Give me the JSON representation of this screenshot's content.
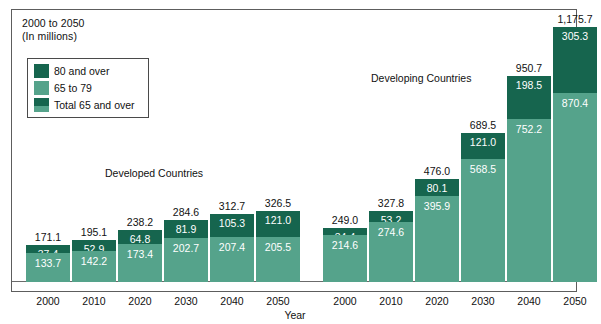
{
  "figure": {
    "title_line1": "2000 to 2050",
    "title_line2": "(In millions)",
    "xaxis_title": "Year",
    "group_label_developed": "Developed Countries",
    "group_label_developing": "Developing Countries",
    "colors": {
      "upper_segment": "#16654e",
      "lower_segment": "#55a38b",
      "frame": "#5d5d5d",
      "text": "#111111",
      "value_text": "#ffffff"
    }
  },
  "legend": {
    "items": [
      {
        "label": "80 and over",
        "swatch": "dark"
      },
      {
        "label": "65 to 79",
        "swatch": "light"
      },
      {
        "label": "Total 65 and over",
        "swatch": "stack"
      }
    ]
  },
  "chart_data": {
    "type": "bar",
    "title": "2000 to 2050 (In millions)",
    "xlabel": "Year",
    "ylabel": "",
    "stacked": true,
    "grid": false,
    "legend_position": "top-left",
    "ylim": [
      0,
      1250
    ],
    "groups": [
      "Developed Countries",
      "Developing Countries"
    ],
    "categories": [
      "2000",
      "2010",
      "2020",
      "2030",
      "2040",
      "2050",
      "2000",
      "2010",
      "2020",
      "2030",
      "2040",
      "2050"
    ],
    "series": [
      {
        "name": "65 to 79",
        "values": [
          133.7,
          142.2,
          173.4,
          202.7,
          207.4,
          205.5,
          214.6,
          274.6,
          395.9,
          568.5,
          752.2,
          870.4
        ]
      },
      {
        "name": "80 and over",
        "values": [
          37.4,
          52.9,
          64.8,
          81.9,
          105.3,
          121.0,
          34.4,
          53.2,
          80.1,
          121.0,
          198.5,
          305.3
        ]
      }
    ],
    "totals_label": "Total 65 and over",
    "totals": [
      "171.1",
      "195.1",
      "238.2",
      "284.6",
      "312.7",
      "326.5",
      "249.0",
      "327.8",
      "476.0",
      "689.5",
      "950.7",
      "1,175.7"
    ],
    "bars": [
      {
        "group": "Developed Countries",
        "year": "2000",
        "total": "171.1",
        "upper": "37.4",
        "lower": "133.7"
      },
      {
        "group": "Developed Countries",
        "year": "2010",
        "total": "195.1",
        "upper": "52.9",
        "lower": "142.2"
      },
      {
        "group": "Developed Countries",
        "year": "2020",
        "total": "238.2",
        "upper": "64.8",
        "lower": "173.4"
      },
      {
        "group": "Developed Countries",
        "year": "2030",
        "total": "284.6",
        "upper": "81.9",
        "lower": "202.7"
      },
      {
        "group": "Developed Countries",
        "year": "2040",
        "total": "312.7",
        "upper": "105.3",
        "lower": "207.4"
      },
      {
        "group": "Developed Countries",
        "year": "2050",
        "total": "326.5",
        "upper": "121.0",
        "lower": "205.5"
      },
      {
        "group": "Developing Countries",
        "year": "2000",
        "total": "249.0",
        "upper": "34.4",
        "lower": "214.6"
      },
      {
        "group": "Developing Countries",
        "year": "2010",
        "total": "327.8",
        "upper": "53.2",
        "lower": "274.6"
      },
      {
        "group": "Developing Countries",
        "year": "2020",
        "total": "476.0",
        "upper": "80.1",
        "lower": "395.9"
      },
      {
        "group": "Developing Countries",
        "year": "2030",
        "total": "689.5",
        "upper": "121.0",
        "lower": "568.5"
      },
      {
        "group": "Developing Countries",
        "year": "2040",
        "total": "950.7",
        "upper": "198.5",
        "lower": "752.2"
      },
      {
        "group": "Developing Countries",
        "year": "2050",
        "total": "1,175.7",
        "upper": "305.3",
        "lower": "870.4"
      }
    ]
  }
}
